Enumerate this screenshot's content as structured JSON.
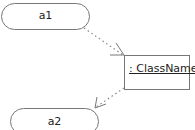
{
  "diagram": {
    "type": "uml-activity-object-flow",
    "nodes": [
      {
        "id": "a1",
        "kind": "action",
        "label": "a1"
      },
      {
        "id": "obj",
        "kind": "object",
        "label": ": ClassName"
      },
      {
        "id": "a2",
        "kind": "action",
        "label": "a2"
      }
    ],
    "edges": [
      {
        "from": "a1",
        "to": "obj",
        "style": "dotted",
        "arrow": "open"
      },
      {
        "from": "obj",
        "to": "a2",
        "style": "dotted",
        "arrow": "open"
      }
    ],
    "colors": {
      "stroke": "#6e6e6e",
      "text": "#222222",
      "background": "#ffffff"
    }
  }
}
